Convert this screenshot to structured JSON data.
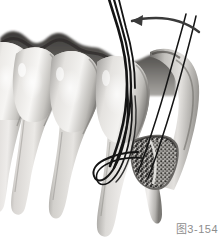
{
  "figure": {
    "caption": "图3-154",
    "modality": "grayscale medical illustration",
    "background_color": "#ffffff"
  },
  "palette": {
    "background": "#ffffff",
    "enamel_light": "#f2f1ef",
    "enamel_mid": "#d6d4d1",
    "enamel_shadow": "#9b9996",
    "root_light": "#e2e0dd",
    "root_mid": "#b9b6b2",
    "root_shadow": "#82807d",
    "gingiva_dark": "#4a4846",
    "gingiva_mid": "#6f6d6a",
    "graft_dark": "#3b3a38",
    "graft_mid": "#7b7976",
    "instrument_stroke": "#141414",
    "arrow_stroke": "#3a3a3a",
    "caption_text": "#8d8d8d"
  },
  "annotations": {
    "arrow_label": "retraction direction arrow",
    "arrow_direction": "right-to-left curved"
  },
  "anatomy": {
    "teeth": [
      {
        "name": "molar-left",
        "label": "磨牙"
      },
      {
        "name": "premolar-second",
        "label": "第二前磨牙"
      },
      {
        "name": "premolar-first",
        "label": "第一前磨牙"
      },
      {
        "name": "canine",
        "label": "尖牙"
      }
    ],
    "structures": [
      {
        "name": "gingival-margin",
        "label": "龈缘"
      },
      {
        "name": "bone-defect",
        "label": "骨缺损区"
      },
      {
        "name": "bone-graft-material",
        "label": "植骨材料"
      },
      {
        "name": "periodontal-instrument",
        "label": "牙周器械"
      },
      {
        "name": "mucoperiosteal-flap",
        "label": "黏骨膜瓣"
      }
    ]
  }
}
